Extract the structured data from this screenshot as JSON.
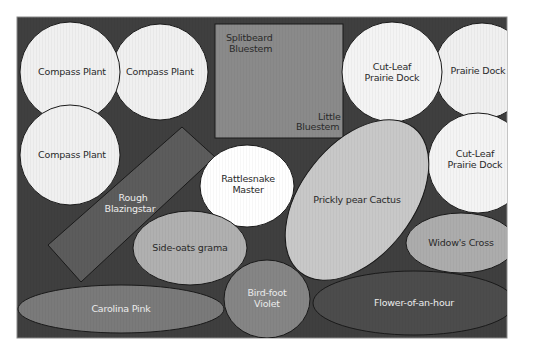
{
  "diagram": {
    "colors": {
      "page_bg": "#ffffff",
      "panel_bg": "#3f3f3f",
      "outline": "#1a1a1a",
      "white_plant": "#f2f2f2",
      "light_gray_plant": "#c4c4c4",
      "mid_gray_plant": "#8c8c8c",
      "dark_gray_plant": "#555555",
      "bluestem_square": "#8a8a8a",
      "blazingstar_rect": "#5c5c5c",
      "carolina_pink": "#7a7a7a",
      "bird_foot_violet": "#858585",
      "flower_of_an_hour": "#4c4c4c"
    },
    "plants": {
      "compass_plant_1": {
        "label": "Compass Plant"
      },
      "compass_plant_2": {
        "label": "Compass Plant"
      },
      "compass_plant_3": {
        "label": "Compass Plant"
      },
      "bluestem_square": {
        "label_top_line1": "Splitbeard",
        "label_top_line2": "Bluestem",
        "label_bottom_line1": "Little",
        "label_bottom_line2": "Bluestem"
      },
      "cut_leaf_prairie_dock_1": {
        "line1": "Cut-Leaf",
        "line2": "Prairie Dock"
      },
      "prairie_dock": {
        "label": "Prairie Dock"
      },
      "cut_leaf_prairie_dock_2": {
        "line1": "Cut-Leaf",
        "line2": "Prairie Dock"
      },
      "rough_blazingstar": {
        "line1": "Rough",
        "line2": "Blazingstar"
      },
      "rattlesnake_master": {
        "line1": "Rattlesnake",
        "line2": "Master"
      },
      "prickly_pear_cactus": {
        "label": "Prickly pear Cactus"
      },
      "side_oats_grama": {
        "label": "Side-oats grama"
      },
      "widows_cross": {
        "label": "Widow's Cross"
      },
      "carolina_pink": {
        "label": "Carolina Pink"
      },
      "bird_foot_violet": {
        "line1": "Bird-foot",
        "line2": "Violet"
      },
      "flower_of_an_hour": {
        "label": "Flower-of-an-hour"
      }
    }
  }
}
